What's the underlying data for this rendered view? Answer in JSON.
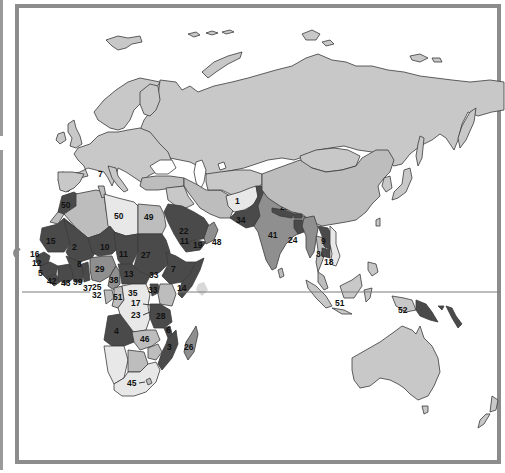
{
  "map": {
    "region": "Europe, Africa, Asia and Oceania",
    "legend_scheme": "grayscale choropleth; darker = higher rank number group",
    "colors": {
      "background": "#ffffff",
      "frame": "#8c8c8c",
      "base_land": "#c8c8c8",
      "lightest": "#e8e8e8",
      "light": "#bdbdbd",
      "medium": "#8f8f8f",
      "dark": "#4a4a4a",
      "equator_line": "#7a7a7a"
    },
    "labels": [
      {
        "id": "1",
        "text": "1",
        "region": "Afghanistan"
      },
      {
        "id": "2",
        "text": "2",
        "region": "Mali"
      },
      {
        "id": "3",
        "text": "3",
        "region": "Mozambique"
      },
      {
        "id": "4",
        "text": "4",
        "region": "Angola"
      },
      {
        "id": "5",
        "text": "5",
        "region": "Sierra Leone"
      },
      {
        "id": "6",
        "text": "6",
        "region": "Malawi/Tanzania south"
      },
      {
        "id": "7",
        "text": "7",
        "region": "Ethiopia"
      },
      {
        "id": "8",
        "text": "8",
        "region": "Burkina Faso"
      },
      {
        "id": "9",
        "text": "9",
        "region": "Cambodia"
      },
      {
        "id": "10",
        "text": "10",
        "region": "Niger"
      },
      {
        "id": "11",
        "text": "11",
        "region": "Chad"
      },
      {
        "id": "12",
        "text": "12",
        "region": "Guinea-Bissau"
      },
      {
        "id": "13",
        "text": "13",
        "region": "Central African Republic"
      },
      {
        "id": "14",
        "text": "14",
        "region": "Somalia"
      },
      {
        "id": "15",
        "text": "15",
        "region": "Mauritania"
      },
      {
        "id": "16",
        "text": "16",
        "region": "Gambia"
      },
      {
        "id": "17",
        "text": "17",
        "region": "Rwanda"
      },
      {
        "id": "18",
        "text": "18",
        "region": "Vietnam south"
      },
      {
        "id": "19",
        "text": "19",
        "region": "Yemen"
      },
      {
        "id": "20",
        "text": "20",
        "region": "Bhutan"
      },
      {
        "id": "21",
        "text": "21",
        "region": "Nepal"
      },
      {
        "id": "22",
        "text": "22",
        "region": "Saudi Arabia/Sudan label"
      },
      {
        "id": "23",
        "text": "23",
        "region": "Burundi"
      },
      {
        "id": "24",
        "text": "24",
        "region": "Bangladesh"
      },
      {
        "id": "25",
        "text": "25",
        "region": "Togo"
      },
      {
        "id": "26",
        "text": "26",
        "region": "Madagascar"
      },
      {
        "id": "27",
        "text": "27",
        "region": "Sudan"
      },
      {
        "id": "28",
        "text": "28",
        "region": "Tanzania"
      },
      {
        "id": "29",
        "text": "29",
        "region": "Nigeria"
      },
      {
        "id": "32",
        "text": "32",
        "region": "Gabon/Eq. Guinea"
      },
      {
        "id": "33",
        "text": "33",
        "region": "Uganda"
      },
      {
        "id": "34",
        "text": "34",
        "region": "Pakistan"
      },
      {
        "id": "35",
        "text": "35",
        "region": "Dem. Rep. Congo"
      },
      {
        "id": "36",
        "text": "36",
        "region": "Laos"
      },
      {
        "id": "37",
        "text": "37",
        "region": "Ghana"
      },
      {
        "id": "38",
        "text": "38",
        "region": "Cameroon"
      },
      {
        "id": "39",
        "text": "39",
        "region": "India"
      },
      {
        "id": "40",
        "text": "40",
        "region": "Liberia"
      },
      {
        "id": "41",
        "text": "41",
        "region": "Ghana coast"
      },
      {
        "id": "42",
        "text": "42",
        "region": "Oman"
      },
      {
        "id": "43",
        "text": "43",
        "region": "Cote d'Ivoire"
      },
      {
        "id": "44",
        "text": "44",
        "region": "Lesotho"
      },
      {
        "id": "45",
        "text": "45",
        "region": "Zambia"
      },
      {
        "id": "46",
        "text": "46",
        "region": "Egypt"
      },
      {
        "id": "48",
        "text": "48",
        "region": "Libya"
      },
      {
        "id": "49",
        "text": "49",
        "region": "Morocco"
      },
      {
        "id": "50a",
        "text": "50",
        "region": "Indonesia"
      },
      {
        "id": "50b",
        "text": "50",
        "region": "Papua New Guinea west"
      },
      {
        "id": "51",
        "text": "51",
        "region": "Congo"
      },
      {
        "id": "52",
        "text": "52",
        "region": "Kenya"
      },
      {
        "id": "7b",
        "text": "7",
        "region": "Italy islands"
      }
    ]
  }
}
